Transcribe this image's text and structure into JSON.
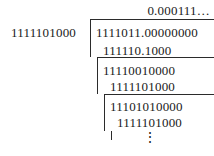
{
  "figure": {
    "type": "binary-long-division",
    "quotient": "0.000111…",
    "divisor": "1111101000",
    "dividend": "1111011.00000000",
    "steps": [
      {
        "subtrahend": "111110.1000",
        "remainder": "11110010000"
      },
      {
        "subtrahend": "1111101000",
        "remainder": "11101010000"
      },
      {
        "subtrahend": "1111101000",
        "remainder": null
      }
    ],
    "continuation": "⋮"
  },
  "rows": {
    "quotient": "0.000111…",
    "divisor": "1111101000",
    "dividend": "1111011.00000000",
    "sub_1": "111110.1000",
    "rem_1": "11110010000",
    "sub_2": "1111101000",
    "rem_2": "11101010000",
    "sub_3": "1111101000",
    "vdots": "⋮"
  }
}
